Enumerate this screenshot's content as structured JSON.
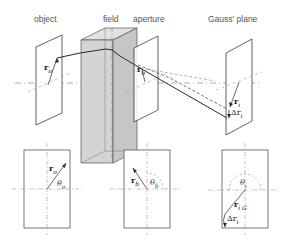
{
  "diagram": {
    "headers": {
      "object": "object",
      "field": "field",
      "aperture": "aperture",
      "gauss": "Gauss' plane"
    },
    "symbols": {
      "r_o": "r",
      "r_o_sub": "o",
      "r_b": "r",
      "r_b_sub": "b",
      "r_i": "r",
      "r_i_sub": "i",
      "delta_r_i": "Δr",
      "delta_r_i_sub": "i",
      "theta_o": "θ",
      "theta_o_sub": "o",
      "theta_b": "θ",
      "theta_b_sub": "b",
      "theta_i": "θ",
      "theta_i_sub": "i",
      "r_iG": "r",
      "r_iG_sub": "i G",
      "delta_r_i_bottom": "Δr",
      "delta_r_i_bottom_sub": "i"
    },
    "colors": {
      "line": "#3a3a3a",
      "field_fill": "#d4d4d4",
      "field_side": "#c6c6c6",
      "field_top": "#e2e2e2",
      "dash": "#8a8a8a"
    }
  }
}
